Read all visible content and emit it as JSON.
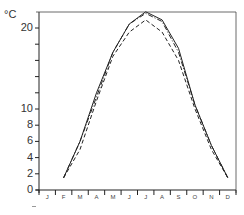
{
  "chart_data": {
    "type": "line",
    "title": "",
    "xlabel": "",
    "ylabel": "°C",
    "categories": [
      "J",
      "F",
      "M",
      "A",
      "M",
      "J",
      "J",
      "A",
      "S",
      "O",
      "N",
      "D"
    ],
    "yticks_labeled": [
      0,
      2,
      4,
      6,
      8,
      10,
      20
    ],
    "ylim": [
      0,
      22
    ],
    "grid": false,
    "legend": null,
    "series": [
      {
        "name": "series-solid",
        "style": "solid",
        "values": [
          null,
          1.5,
          6.0,
          12.0,
          17.0,
          20.5,
          22.0,
          21.0,
          17.5,
          10.5,
          5.5,
          1.5
        ]
      },
      {
        "name": "series-dashdot",
        "style": "dashdot",
        "values": [
          null,
          1.5,
          6.0,
          11.5,
          17.0,
          20.5,
          21.8,
          20.8,
          17.0,
          10.5,
          5.5,
          1.5
        ]
      },
      {
        "name": "series-dashed",
        "style": "dashed",
        "values": [
          null,
          1.5,
          5.0,
          11.0,
          16.5,
          19.5,
          21.0,
          19.5,
          16.0,
          10.0,
          5.0,
          1.5
        ]
      }
    ]
  },
  "axis": {
    "unit": "°C",
    "y_labels": [
      "20",
      "10",
      "8",
      "6",
      "4",
      "2",
      "0"
    ],
    "x_labels": [
      "J",
      "F",
      "M",
      "A",
      "M",
      "J",
      "J",
      "A",
      "S",
      "O",
      "N",
      "D"
    ]
  }
}
